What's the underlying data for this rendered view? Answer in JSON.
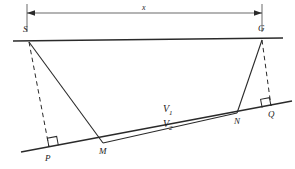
{
  "figure": {
    "stroke_color": "#262626",
    "background_color": "#ffffff",
    "points": [
      {
        "id": "S",
        "label": "S",
        "x": 29,
        "y": 42,
        "label_x": 23,
        "label_y": 28
      },
      {
        "id": "G",
        "label": "G",
        "x": 262,
        "y": 40,
        "label_x": 258,
        "label_y": 27
      },
      {
        "id": "P",
        "label": "P",
        "x": 49,
        "y": 147,
        "label_x": 45,
        "label_y": 155
      },
      {
        "id": "M",
        "label": "M",
        "x": 103,
        "y": 143,
        "label_x": 99,
        "label_y": 148
      },
      {
        "id": "N",
        "label": "N",
        "x": 237,
        "y": 113,
        "label_x": 234,
        "label_y": 118
      },
      {
        "id": "Q",
        "label": "Q",
        "x": 271,
        "y": 106,
        "label_x": 268,
        "label_y": 111
      }
    ],
    "dimension": {
      "label": "x",
      "label_x": 142,
      "label_y": 8,
      "left_x": 27,
      "right_x": 262,
      "line_y": 13,
      "tick_top": 4,
      "tick_bottom": 32
    },
    "velocity_labels": [
      {
        "id": "V1",
        "text": "V",
        "sub": "1",
        "x": 163,
        "y": 106
      },
      {
        "id": "V2",
        "text": "V",
        "sub": "2",
        "x": 163,
        "y": 121
      }
    ],
    "lines": {
      "surface": {
        "x1": 13,
        "y1": 41,
        "x2": 283,
        "y2": 38,
        "style": "solid"
      },
      "interface": {
        "x1": 21,
        "y1": 152,
        "x2": 292,
        "y2": 101,
        "style": "solid"
      },
      "ray_s_m": {
        "x1": 29,
        "y1": 42,
        "x2": 103,
        "y2": 143,
        "style": "solid"
      },
      "ray_m_n": {
        "x1": 103,
        "y1": 143,
        "x2": 237,
        "y2": 113,
        "style": "solid"
      },
      "ray_n_g": {
        "x1": 237,
        "y1": 113,
        "x2": 262,
        "y2": 40,
        "style": "solid"
      },
      "perp_s_p": {
        "x1": 29,
        "y1": 42,
        "x2": 49,
        "y2": 147,
        "style": "dashed"
      },
      "perp_g_q": {
        "x1": 262,
        "y1": 40,
        "x2": 271,
        "y2": 106,
        "style": "dashed"
      }
    },
    "right_angles": [
      {
        "id": "angle-at-P",
        "x": 49,
        "y": 147
      },
      {
        "id": "angle-at-Q",
        "x": 271,
        "y": 106
      }
    ]
  }
}
